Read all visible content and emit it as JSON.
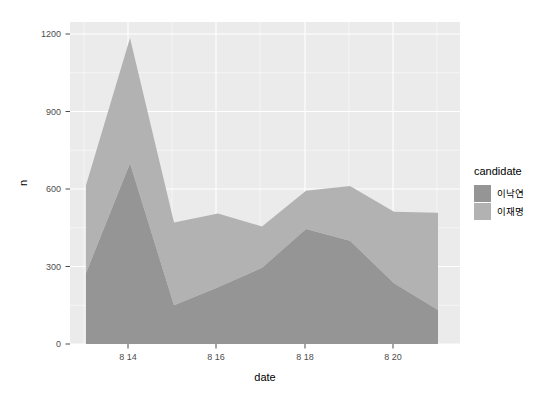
{
  "chart_data": {
    "type": "area",
    "stacked": true,
    "title": "",
    "subtitle": "",
    "xlabel": "date",
    "ylabel": "n",
    "x": [
      "8 13",
      "8 14",
      "8 15",
      "8 16",
      "8 17",
      "8 18",
      "8 19",
      "8 20",
      "8 21"
    ],
    "x_tick_labels": [
      "8 14",
      "8 16",
      "8 18",
      "8 20"
    ],
    "x_tick_values": [
      "8 14",
      "8 16",
      "8 18",
      "8 20"
    ],
    "y_tick_labels": [
      "0",
      "300",
      "600",
      "900",
      "1200"
    ],
    "y_tick_values": [
      0,
      300,
      600,
      900,
      1200
    ],
    "ylim": [
      0,
      1270
    ],
    "xlim": [
      "8 13",
      "8 21"
    ],
    "grid": true,
    "legend_position": "right",
    "legend_title": "candidate",
    "series": [
      {
        "name": "이낙연",
        "color": "#959595",
        "values": [
          275,
          700,
          150,
          220,
          295,
          445,
          400,
          235,
          132
        ]
      },
      {
        "name": "이재명",
        "color": "#b2b2b2",
        "values": [
          340,
          485,
          320,
          285,
          160,
          148,
          212,
          277,
          376
        ]
      }
    ],
    "totals": [
      615,
      1185,
      470,
      505,
      455,
      593,
      612,
      512,
      508
    ],
    "annotations": []
  },
  "legend": {
    "title": "candidate",
    "items": [
      {
        "label": "이낙연",
        "color": "#959595"
      },
      {
        "label": "이재명",
        "color": "#b2b2b2"
      }
    ]
  },
  "axes": {
    "x_title": "date",
    "y_title": "n"
  },
  "colors": {
    "panel_background": "#ebebeb",
    "grid": "#ffffff",
    "text": "#4d4d4d",
    "series_1": "#959595",
    "series_2": "#b2b2b2"
  }
}
